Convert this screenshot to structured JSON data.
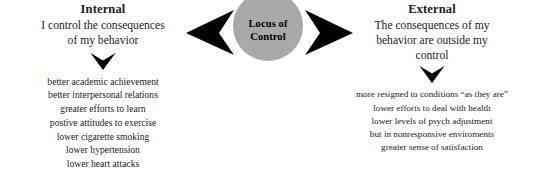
{
  "colors": {
    "background": "#ffffff",
    "circle_fill": "#a9a9a9",
    "arrow_fill": "#000000",
    "text": "#1a1a1a"
  },
  "center": {
    "label_line1": "Locus of",
    "label_line2": "Control",
    "left_arrow_icon": "arrow-left-icon",
    "right_arrow_icon": "arrow-right-icon"
  },
  "internal": {
    "heading": "Internal",
    "subtitle_line1": "I control the consequences",
    "subtitle_line2": "of my behavior",
    "down_arrow_icon": "arrow-down-icon",
    "outcomes": [
      "better academic achievement",
      "better interpersonal relations",
      "greater efforts to learn",
      "postive attitudes to exercise",
      "lower cigarette smoking",
      "lower hypertension",
      "lower heart attacks"
    ]
  },
  "external": {
    "heading": "External",
    "subtitle_line1": "The consequences of my",
    "subtitle_line2": "behavior are outside my",
    "subtitle_line3": "control",
    "down_arrow_icon": "arrow-down-icon",
    "outcomes": [
      "more resigned to conditions “as they are”",
      "lower efforts to deal with health",
      "lower levels of psych adjustment",
      "but in nonresponsive enviroments",
      "greater sense of satisfaction"
    ]
  }
}
